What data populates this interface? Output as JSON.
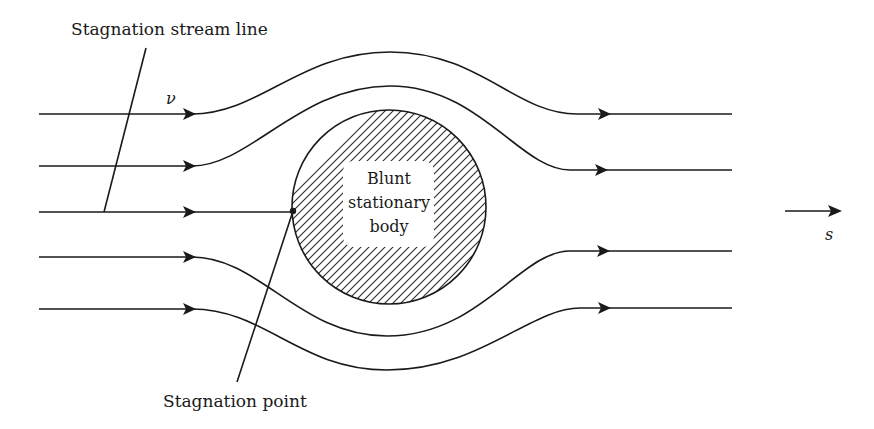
{
  "diagram": {
    "title_label": "Stagnation stream line",
    "velocity_symbol": "ν",
    "body_label": {
      "line1": "Blunt",
      "line2": "stationary",
      "line3": "body"
    },
    "stagnation_point_label": "Stagnation point",
    "direction_symbol": "s",
    "streamlines_count": 5,
    "colors": {
      "ink": "#1a1a1a",
      "background": "#ffffff"
    }
  }
}
